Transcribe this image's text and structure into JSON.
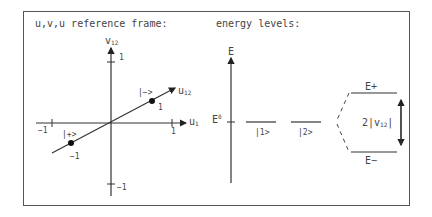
{
  "left_panel": {
    "title": "u,v,u reference frame:",
    "v_axis_label": "v",
    "v_axis_sub": "12",
    "u_axis_label": "u",
    "u_axis_sub": "1",
    "line_label": "u",
    "line_label_sub": "12",
    "tick_v_pos": "1",
    "tick_v_neg": "−1",
    "tick_u_pos": "1",
    "tick_u_neg": "−1",
    "point_minus": "|−>",
    "point_minus_coord": "1",
    "point_plus": "|+>",
    "point_plus_coord": "−1"
  },
  "right_panel": {
    "title": "energy levels:",
    "e_axis_label": "E",
    "e0_label": "E",
    "e0_sup": "0",
    "level1": "|1>",
    "level2": "|2>",
    "e_plus": "E+",
    "e_minus": "E−",
    "splitting_prefix": "2|v",
    "splitting_sub": "12",
    "splitting_suffix": "|",
    "bracket": "<"
  },
  "colors": {
    "line": "#333333",
    "frame": "#555555"
  }
}
